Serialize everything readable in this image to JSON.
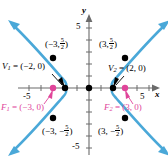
{
  "figure": {
    "kind": "hyperbola-graph",
    "axes": {
      "x_label": "x",
      "y_label": "y",
      "x_ticks_labeled": [
        "-5",
        "5"
      ],
      "y_ticks_labeled": [
        "5",
        "-5"
      ],
      "x_tick_neg5": "-5",
      "x_tick_pos5": "5",
      "y_tick_pos5": "5",
      "y_tick_neg5": "-5",
      "x_range": [
        -6.5,
        6.5
      ],
      "y_range": [
        -6.5,
        6.5
      ]
    },
    "colors": {
      "curve": "#4aa8d8",
      "focus": "#e0459a",
      "vertex": "#000000",
      "axis": "#6b6b6b",
      "point": "#000000"
    },
    "labels": {
      "vertex1": "V",
      "vertex1_sub": "1",
      "vertex1_eq": " = (−2, 0)",
      "vertex2": "V",
      "vertex2_sub": "2",
      "vertex2_eq": " = (2, 0)",
      "focus1": "F",
      "focus1_sub": "1",
      "focus1_eq": " = (−3, 0)",
      "focus2": "F",
      "focus2_sub": "2",
      "focus2_eq": " = (3, 0)",
      "pt_tl_open": "(−3, ",
      "pt_tl_close": ")",
      "pt_tr_open": "(3, ",
      "pt_tr_close": ")",
      "pt_bl_open": "(−3, −",
      "pt_bl_close": ")",
      "pt_br_open": "(3, −",
      "pt_br_close": ")",
      "frac_num": "5",
      "frac_den": "2"
    },
    "curve_points": {
      "vertices": [
        {
          "name": "V1",
          "x": -2,
          "y": 0
        },
        {
          "name": "V2",
          "x": 2,
          "y": 0
        }
      ],
      "foci": [
        {
          "name": "F1",
          "x": -3,
          "y": 0
        },
        {
          "name": "F2",
          "x": 3,
          "y": 0
        }
      ],
      "latus_rectum_points": [
        {
          "x": -3,
          "y": 2.5
        },
        {
          "x": 3,
          "y": 2.5
        },
        {
          "x": -3,
          "y": -2.5
        },
        {
          "x": 3,
          "y": -2.5
        }
      ],
      "origin": {
        "x": 0,
        "y": 0
      }
    },
    "equation_implied": "x^2/4 - y^2/5 = 1"
  }
}
